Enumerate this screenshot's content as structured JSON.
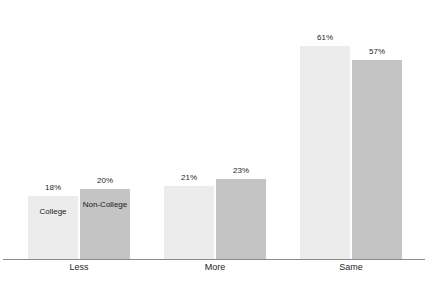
{
  "chart_data": {
    "type": "bar",
    "title": "",
    "subtitle": "",
    "xlabel": "",
    "ylabel": "",
    "ylim": [
      0,
      70
    ],
    "grid": false,
    "legend_position": "inside-first-group-bars",
    "value_suffix": "%",
    "categories": [
      "Less",
      "More",
      "Same"
    ],
    "series": [
      {
        "name": "College",
        "color": "#ececec",
        "values": [
          18,
          21,
          61
        ],
        "value_labels": [
          "18%",
          "21%",
          "61%"
        ]
      },
      {
        "name": "Non-College",
        "color": "#c4c4c4",
        "values": [
          20,
          23,
          57
        ],
        "value_labels": [
          "20%",
          "23%",
          "57%"
        ]
      }
    ]
  },
  "legend": {
    "series_0_label": "College",
    "series_1_label": "Non-College"
  },
  "axis": {
    "baseline_color": "#8a8a8a"
  },
  "categories": {
    "c0": "Less",
    "c1": "More",
    "c2": "Same"
  },
  "values": {
    "g0s0": "18%",
    "g0s1": "20%",
    "g1s0": "21%",
    "g1s1": "23%",
    "g2s0": "61%",
    "g2s1": "57%"
  }
}
